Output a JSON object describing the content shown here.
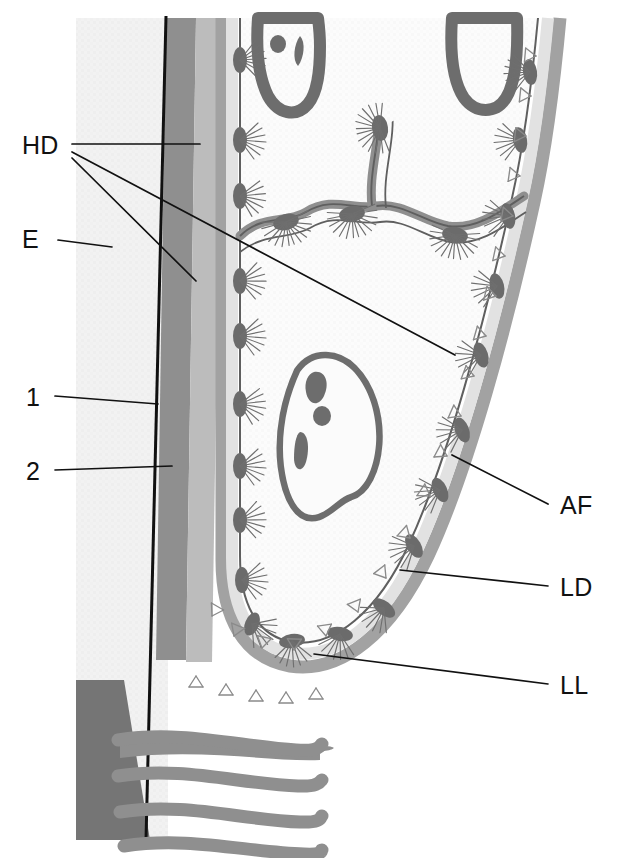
{
  "figure": {
    "background_color": "#ffffff",
    "width": 622,
    "height": 858
  },
  "labels": [
    {
      "id": "HD",
      "text": "HD",
      "meaning": "hemidesmosome",
      "x": 22,
      "y": 150,
      "side": "left"
    },
    {
      "id": "E",
      "text": "E",
      "meaning": "epidermis",
      "x": 22,
      "y": 236,
      "side": "left"
    },
    {
      "id": "1",
      "text": "1",
      "meaning": "layer-1",
      "x": 26,
      "y": 399,
      "side": "left"
    },
    {
      "id": "2",
      "text": "2",
      "meaning": "layer-2",
      "x": 26,
      "y": 474,
      "side": "left"
    },
    {
      "id": "AF",
      "text": "AF",
      "meaning": "anchoring fibrils",
      "x": 560,
      "y": 508,
      "side": "right"
    },
    {
      "id": "LD",
      "text": "LD",
      "meaning": "lamina densa",
      "x": 560,
      "y": 592,
      "side": "right"
    },
    {
      "id": "LL",
      "text": "LL",
      "meaning": "lamina lucida",
      "x": 560,
      "y": 690,
      "side": "right"
    }
  ],
  "leader_lines": [
    {
      "for": "HD",
      "points": "72,144 200,144"
    },
    {
      "for": "HD",
      "points": "72,152 455,355"
    },
    {
      "for": "HD",
      "points": "72,158 196,281"
    },
    {
      "for": "E",
      "points": "58,240 112,247"
    },
    {
      "for": "1",
      "points": "55,396 158,404"
    },
    {
      "for": "2",
      "points": "55,470 172,466"
    },
    {
      "for": "AF",
      "points": "548,504 452,455"
    },
    {
      "for": "LD",
      "points": "548,586 400,570"
    },
    {
      "for": "LL",
      "points": "548,684 314,654"
    }
  ],
  "colors": {
    "background": "#ffffff",
    "epidermis_light": "#e3e3e3",
    "layer_dark_band": "#8e8e8e",
    "layer_mid_band": "#b4b4b4",
    "cell_interior": "#f7f7f7",
    "lamina_lucida": "#e8e8e8",
    "lamina_densa": "#9e9e9e",
    "nucleus_outline": "#6d6d6d",
    "hemidesmosome": "#6b6b6b",
    "collagen_fiber": "#8c8c8c",
    "dark_block": "#6f6f6f",
    "black_line": "#111111",
    "label_text": "#111111"
  },
  "structures": {
    "epidermis_strip": {
      "name": "epidermis",
      "x": 76,
      "width": 92
    },
    "dark_band": {
      "name": "layer-1-band",
      "label_ref": "1"
    },
    "mid_band": {
      "name": "layer-2-band",
      "label_ref": "2"
    },
    "nuclei": [
      {
        "name": "nucleus-top-left",
        "shape": "u-shaped"
      },
      {
        "name": "nucleus-top-right",
        "shape": "u-shaped"
      },
      {
        "name": "nucleus-central",
        "shape": "irregular-oval-with-nucleoli"
      }
    ],
    "collagen_fibers": {
      "name": "collagen-fiber-bundles",
      "count": 4
    },
    "hemidesmosome_count": 28
  }
}
